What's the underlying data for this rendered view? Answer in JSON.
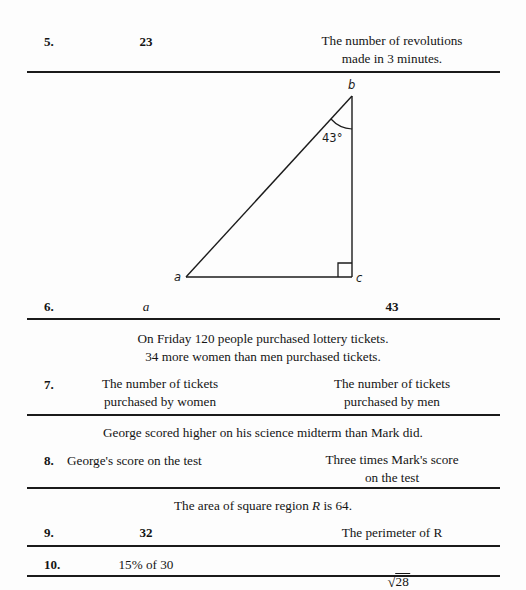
{
  "document": {
    "type": "quantitative-comparison-worksheet",
    "background_color": "#fdfdfd",
    "text_color": "#141414",
    "rule_color": "#1b1b1b"
  },
  "rows": [
    {
      "number": "5.",
      "column_a": "23",
      "column_b_line1": "The number of revolutions",
      "column_b_line2": "made in 3 minutes."
    },
    {
      "number": "6.",
      "column_a": "a",
      "column_b": "43"
    },
    {
      "number": "7.",
      "column_a_line1": "The number of tickets",
      "column_a_line2": "purchased by women",
      "column_b_line1": "The number of tickets",
      "column_b_line2": "purchased by men"
    },
    {
      "number": "8.",
      "column_a": "George's score on the test",
      "column_b_line1": "Three times Mark's score",
      "column_b_line2": "on the test"
    },
    {
      "number": "9.",
      "column_a": "32",
      "column_b": "The perimeter of R"
    },
    {
      "number": "10.",
      "column_a": "15% of 30",
      "column_b_radical_sign": "√",
      "column_b_radicand": "28"
    }
  ],
  "stimuli": {
    "lottery_line1": "On Friday 120 people purchased lottery tickets.",
    "lottery_line2": "34 more women than men purchased tickets.",
    "scores": "George scored higher on his science midterm than Mark did.",
    "square_region_pre": "The area of square region ",
    "square_region_var": "R",
    "square_region_post": " is 64."
  },
  "figure": {
    "name": "right-triangle-abc",
    "vertex_a_label": "a",
    "vertex_b_label": "b",
    "vertex_c_label": "c",
    "angle_label": "43°",
    "angle_value": 43,
    "right_angle_at": "c",
    "stroke_color": "#1b1b1b"
  }
}
